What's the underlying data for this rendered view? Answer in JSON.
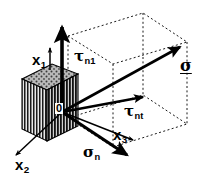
{
  "figure": {
    "background_color": "#ffffff",
    "stroke_color": "#000000",
    "width": 201,
    "height": 182
  },
  "labels": {
    "origin": "0",
    "axis_x1_base": "x",
    "axis_x1_sub": "1",
    "axis_x2_base": "x",
    "axis_x2_sub": "2",
    "axis_x3_base": "x",
    "axis_x3_sub": "3",
    "tau_n1_base": "τ",
    "tau_n1_sub": "n1",
    "tau_nt_base": "τ",
    "tau_nt_sub": "nt",
    "sigma_n_base": "σ",
    "sigma_n_sub": "n",
    "sigma_vector": "σ"
  },
  "elements": {
    "block_name": "stippled-hatched-block",
    "dashed_box_name": "projection-box",
    "arrows": [
      {
        "name": "tau-n1-arrow",
        "label": "τn1",
        "style": "thick-vertical-up"
      },
      {
        "name": "sigma-vector-arrow",
        "label": "σ",
        "style": "long-diagonal-up-right"
      },
      {
        "name": "tau-nt-arrow",
        "label": "τnt",
        "style": "medium-diagonal-right"
      },
      {
        "name": "sigma-n-arrow",
        "label": "σn",
        "style": "thick-diagonal-down-right"
      },
      {
        "name": "axis-x1-arrow",
        "label": "x1",
        "style": "thin-vertical-up"
      },
      {
        "name": "axis-x2-arrow",
        "label": "x2",
        "style": "thin-diagonal-down-left"
      },
      {
        "name": "axis-x3-arrow",
        "label": "x3",
        "style": "thin-diagonal-down-right"
      }
    ]
  }
}
